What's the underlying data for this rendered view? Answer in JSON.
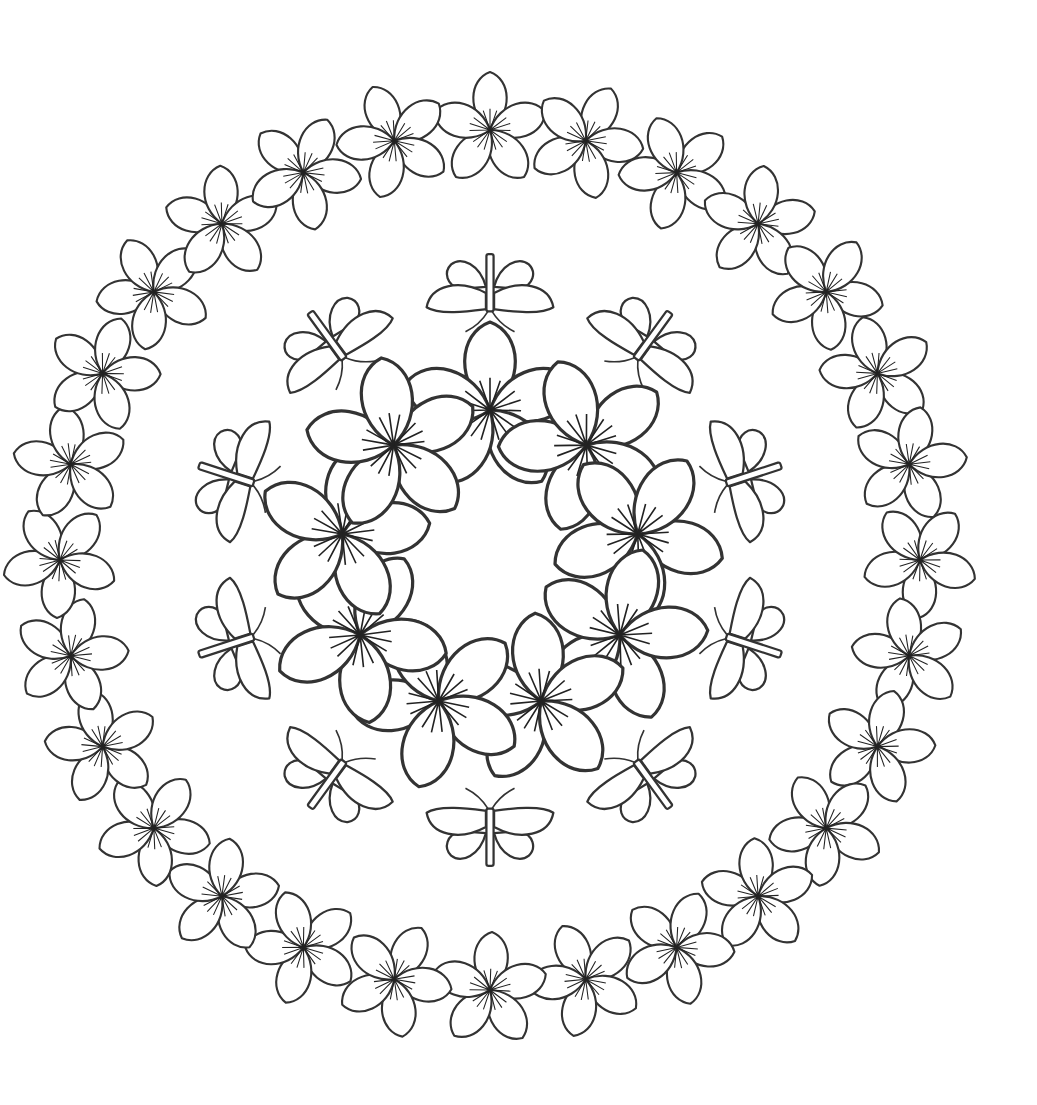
{
  "artwork": {
    "kind": "mandala-coloring-page",
    "background": "#ffffff",
    "stroke": "#333333",
    "center": [
      490,
      560
    ],
    "outer_ring": {
      "count": 28,
      "radius": 430,
      "flower_size": 58,
      "petals": 5
    },
    "butterfly_ring": {
      "count": 10,
      "radius": 265,
      "size": 92
    },
    "inner_ring": {
      "count": 9,
      "radius": 150,
      "flower_size": 88,
      "petals": 5
    }
  }
}
